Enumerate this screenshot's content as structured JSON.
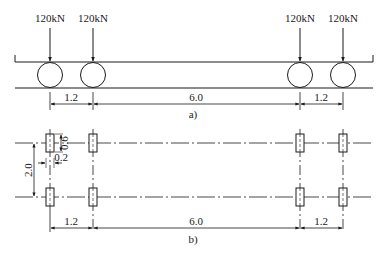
{
  "figure_a": {
    "caption": "a)",
    "loads": [
      {
        "label": "120kN",
        "x": 50
      },
      {
        "label": "120kN",
        "x": 93
      },
      {
        "label": "120kN",
        "x": 300
      },
      {
        "label": "120kN",
        "x": 343
      }
    ],
    "dimensions": [
      {
        "label": "1.2",
        "from": 50,
        "to": 93
      },
      {
        "label": "6.0",
        "from": 93,
        "to": 300
      },
      {
        "label": "1.2",
        "from": 300,
        "to": 343
      }
    ]
  },
  "figure_b": {
    "caption": "b)",
    "vertical_spacing_label": "2.0",
    "patch_length_label": "0.6",
    "patch_width_label": "0.2",
    "dimensions": [
      {
        "label": "1.2",
        "from": 50,
        "to": 93
      },
      {
        "label": "6.0",
        "from": 93,
        "to": 300
      },
      {
        "label": "1.2",
        "from": 300,
        "to": 343
      }
    ]
  },
  "colors": {
    "stroke": "#1a1a1a",
    "background": "#ffffff"
  }
}
